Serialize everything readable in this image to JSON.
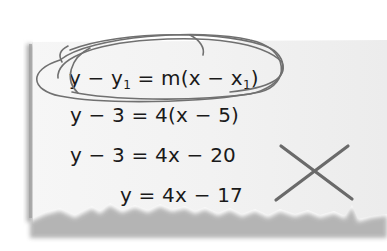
{
  "note": {
    "style": "torn-paper",
    "background_color": "#efefef",
    "shadow_color": "#9a9a9a"
  },
  "equations": [
    {
      "parts": [
        "y − y",
        "1",
        " = m(x − x",
        "1",
        ")"
      ],
      "circled": true
    },
    {
      "text": "y − 3 = 4(x − 5)"
    },
    {
      "text": "y − 3 = 4x − 20"
    },
    {
      "text": "y = 4x − 17"
    }
  ],
  "annotations": {
    "circle": {
      "icon": "pen-circle-scribble",
      "color": "#6b6b6b"
    },
    "cross": {
      "icon": "x-mark-icon",
      "color": "#6a6a6a"
    }
  }
}
